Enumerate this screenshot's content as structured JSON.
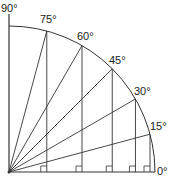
{
  "diagram": {
    "origin": [
      9,
      172
    ],
    "radius": 146,
    "angles": [
      15,
      30,
      45,
      60,
      75
    ],
    "labels": {
      "a90": "90°",
      "a75": "75°",
      "a60": "60°",
      "a45": "45°",
      "a30": "30°",
      "a15": "15°",
      "a0": "0°"
    },
    "colors": {
      "line": "#333333",
      "text": "#222222"
    }
  }
}
